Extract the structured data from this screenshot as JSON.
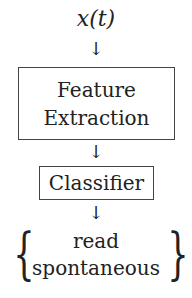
{
  "diagram": {
    "input": "x(t)",
    "arrow_glyph": "↓",
    "blocks": [
      {
        "lines": [
          "Feature",
          "Extraction"
        ]
      },
      {
        "lines": [
          "Classifier"
        ]
      }
    ],
    "output": {
      "brace_left": "{",
      "brace_right": "}",
      "classes": [
        "read",
        "spontaneous"
      ]
    }
  }
}
